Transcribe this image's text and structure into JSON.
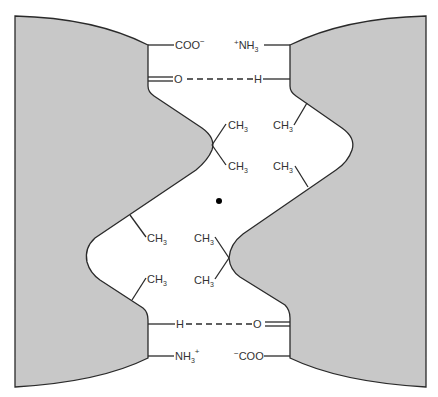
{
  "diagram": {
    "colors": {
      "surface_fill": "#c8c8c8",
      "line": "#2a2a2a",
      "text": "#333333",
      "background": "#ffffff"
    },
    "labels": {
      "top_left_carboxylate": {
        "main": "COO",
        "sup": "−"
      },
      "top_right_ammonium": {
        "pre": "+",
        "main": "NH",
        "sub": "3"
      },
      "top_hbond_acceptor": "O",
      "top_hbond_donor": "H",
      "bottom_hbond_donor": "H",
      "bottom_hbond_acceptor": "O",
      "bottom_left_ammonium": {
        "main": "NH",
        "sub": "3",
        "sup": "+"
      },
      "bottom_right_carboxylate": {
        "pre": "−",
        "main": "COO"
      },
      "methyl": {
        "main": "CH",
        "sub": "3"
      }
    },
    "methyl_groups": [
      {
        "id": "left-upper-a",
        "side": "left"
      },
      {
        "id": "left-upper-b",
        "side": "left"
      },
      {
        "id": "right-upper-a",
        "side": "right"
      },
      {
        "id": "right-upper-b",
        "side": "right"
      },
      {
        "id": "left-lower-a",
        "side": "left"
      },
      {
        "id": "left-lower-b",
        "side": "left"
      },
      {
        "id": "right-lower-a",
        "side": "right"
      },
      {
        "id": "right-lower-b",
        "side": "right"
      }
    ],
    "center_marker": "dot"
  }
}
